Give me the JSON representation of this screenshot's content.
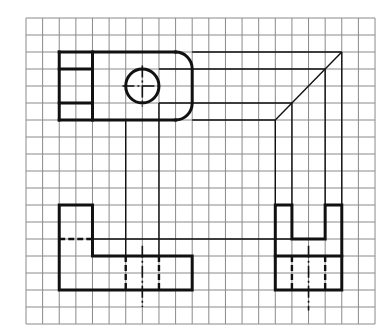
{
  "drawing": {
    "type": "orthographic-projection",
    "grid": {
      "origin_x": 26,
      "origin_y": 18,
      "cell_w": 16.62,
      "cell_h": 17,
      "cols": 21,
      "rows": 18,
      "color": "#8a8a8a"
    },
    "line_color": "#111111",
    "views": {
      "top_view": {
        "visible": [
          {
            "path": [
              [
                2,
                2
              ],
              [
                9,
                2
              ]
            ],
            "note": "top edge to start of round"
          },
          {
            "path": [
              [
                2,
                2
              ],
              [
                2,
                6
              ]
            ]
          },
          {
            "path": [
              [
                2,
                6
              ],
              [
                9,
                6
              ]
            ]
          },
          {
            "path": [
              [
                4,
                2
              ],
              [
                4,
                6
              ]
            ]
          },
          {
            "path": [
              [
                2,
                3
              ],
              [
                4,
                3
              ]
            ]
          },
          {
            "path": [
              [
                2,
                5
              ],
              [
                4,
                5
              ]
            ]
          }
        ],
        "rounded_end": {
          "x_start": 9,
          "x_end": 10,
          "y_top": 2,
          "y_bottom": 6,
          "radius": 1
        },
        "circle": {
          "cx": 7,
          "cy": 4,
          "r": 1
        },
        "centerlines": [
          {
            "path": [
              [
                5.8,
                4
              ],
              [
                8.2,
                4
              ]
            ]
          },
          {
            "path": [
              [
                7,
                2.8
              ],
              [
                7,
                5.2
              ]
            ]
          }
        ]
      },
      "front_view": {
        "visible": [
          {
            "path": [
              [
                2,
                11
              ],
              [
                4,
                11
              ],
              [
                4,
                14
              ],
              [
                10,
                14
              ],
              [
                10,
                16
              ],
              [
                2,
                16
              ],
              [
                2,
                11
              ]
            ]
          }
        ],
        "hidden": [
          {
            "path": [
              [
                2,
                13
              ],
              [
                4,
                13
              ]
            ]
          },
          {
            "path": [
              [
                6,
                14
              ],
              [
                6,
                16
              ]
            ]
          },
          {
            "path": [
              [
                8,
                14
              ],
              [
                8,
                16
              ]
            ]
          }
        ],
        "centerlines": [
          {
            "path": [
              [
                7,
                13.4
              ],
              [
                7,
                17
              ]
            ]
          }
        ]
      },
      "side_view": {
        "visible": [
          {
            "path": [
              [
                15,
                11
              ],
              [
                16,
                11
              ],
              [
                16,
                13
              ],
              [
                18,
                13
              ],
              [
                18,
                11
              ],
              [
                19,
                11
              ],
              [
                19,
                16
              ],
              [
                15,
                16
              ],
              [
                15,
                11
              ]
            ]
          },
          {
            "path": [
              [
                15,
                14
              ],
              [
                19,
                14
              ]
            ]
          }
        ],
        "hidden": [
          {
            "path": [
              [
                16,
                14
              ],
              [
                16,
                16
              ]
            ]
          },
          {
            "path": [
              [
                18,
                14
              ],
              [
                18,
                16
              ]
            ]
          }
        ],
        "centerlines": [
          {
            "path": [
              [
                17,
                13.4
              ],
              [
                17,
                17.2
              ]
            ]
          }
        ]
      }
    },
    "projection_lines": [
      {
        "path": [
          [
            10,
            2
          ],
          [
            19,
            2
          ]
        ]
      },
      {
        "path": [
          [
            8,
            3
          ],
          [
            18,
            3
          ]
        ]
      },
      {
        "path": [
          [
            8,
            5
          ],
          [
            16,
            5
          ]
        ]
      },
      {
        "path": [
          [
            10,
            6
          ],
          [
            15,
            6
          ]
        ]
      },
      {
        "path": [
          [
            15,
            6
          ],
          [
            19,
            2
          ]
        ],
        "note": "45-degree miter line"
      },
      {
        "path": [
          [
            6,
            6
          ],
          [
            6,
            14
          ]
        ]
      },
      {
        "path": [
          [
            8,
            5
          ],
          [
            8,
            14
          ]
        ]
      },
      {
        "path": [
          [
            4,
            13
          ],
          [
            16,
            13
          ]
        ]
      },
      {
        "path": [
          [
            15,
            6
          ],
          [
            15,
            11
          ]
        ]
      },
      {
        "path": [
          [
            16,
            5
          ],
          [
            16,
            11
          ]
        ]
      },
      {
        "path": [
          [
            18,
            3
          ],
          [
            18,
            11
          ]
        ]
      },
      {
        "path": [
          [
            19,
            2
          ],
          [
            19,
            11
          ]
        ]
      }
    ]
  }
}
